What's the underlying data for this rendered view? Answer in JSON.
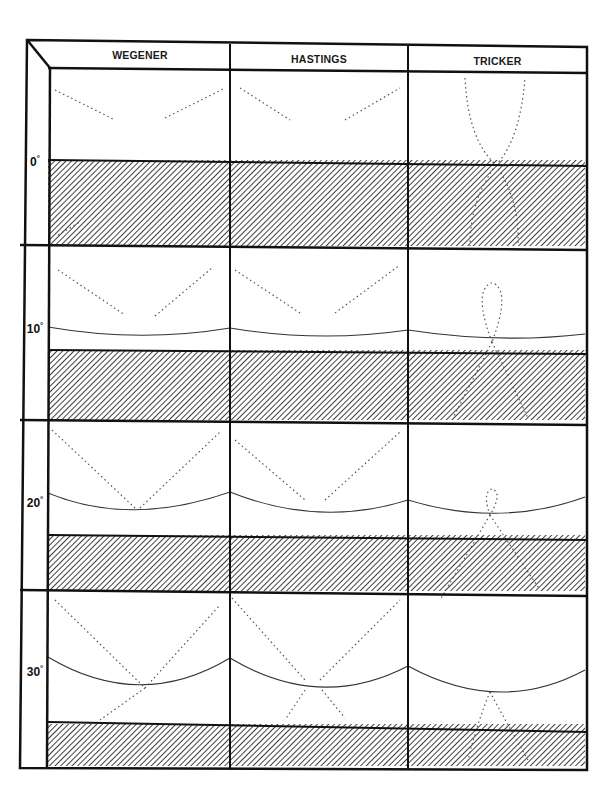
{
  "figure": {
    "columns": [
      {
        "key": "wegener",
        "label": "WEGENER"
      },
      {
        "key": "hastings",
        "label": "HASTINGS"
      },
      {
        "key": "tricker",
        "label": "TRICKER"
      }
    ],
    "rows": [
      {
        "angle": "0",
        "degree_symbol": "°",
        "has_surface_curve": false
      },
      {
        "angle": "10",
        "degree_symbol": "°",
        "has_surface_curve": true
      },
      {
        "angle": "20",
        "degree_symbol": "°",
        "has_surface_curve": true
      },
      {
        "angle": "30",
        "degree_symbol": "°",
        "has_surface_curve": true
      }
    ],
    "colors": {
      "frame": "#111111",
      "hatch": "#2a2a2a",
      "curve": "#333333",
      "dots": "#555555",
      "background": "#ffffff"
    }
  }
}
